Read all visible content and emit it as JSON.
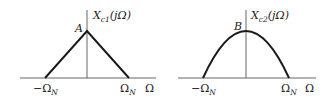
{
  "diagram": {
    "panels": [
      {
        "id": "xc1",
        "title_main": "X",
        "title_sub": "c1",
        "title_arg": "(jΩ)",
        "peak_label": "A",
        "shape": "triangle",
        "left_tick_prefix": "−Ω",
        "left_tick_sub": "N",
        "right_tick_main": "Ω",
        "right_tick_sub": "N",
        "axis_label": "Ω",
        "line_color": "#1a1a1a"
      },
      {
        "id": "xc2",
        "title_main": "X",
        "title_sub": "c2",
        "title_arg": "(jΩ)",
        "peak_label": "B",
        "shape": "parabola",
        "left_tick_prefix": "−Ω",
        "left_tick_sub": "N",
        "right_tick_main": "Ω",
        "right_tick_sub": "N",
        "axis_label": "Ω",
        "line_color": "#1a1a1a"
      }
    ]
  }
}
